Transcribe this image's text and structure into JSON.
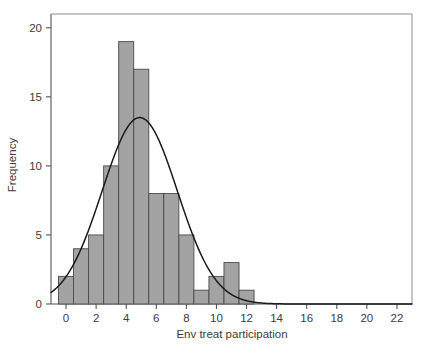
{
  "chart_data": {
    "type": "bar",
    "title": "",
    "subtitle": "",
    "xlabel": "Env treat participation",
    "ylabel": "Frequency",
    "categories": [
      0,
      1,
      2,
      3,
      4,
      5,
      6,
      7,
      8,
      9,
      10,
      11,
      12
    ],
    "values": [
      2,
      4,
      5,
      10,
      19,
      17,
      8,
      8,
      5,
      1,
      2,
      3,
      1
    ],
    "bin_width": 1,
    "n_total": 85,
    "xlim": [
      -1,
      23
    ],
    "ylim": [
      0,
      21
    ],
    "xticks": [
      0,
      2,
      4,
      6,
      8,
      10,
      12,
      14,
      16,
      18,
      20,
      22
    ],
    "xtick_labels": [
      "0",
      "2",
      "4",
      "6",
      "8",
      "10",
      "12",
      "14",
      "16",
      "18",
      "20",
      "22"
    ],
    "yticks": [
      0,
      5,
      10,
      15,
      20
    ],
    "ytick_labels": [
      "0",
      "5",
      "10",
      "15",
      "20"
    ],
    "grid": false,
    "legend": null,
    "legend_position": "none",
    "bar_fill_color": "#a3a3a3",
    "bar_edge_color": "#4a4a4a",
    "overlay": {
      "name": "normal-curve",
      "type": "line",
      "stroke_color": "#1a1a1a",
      "mean": 4.9,
      "sd": 2.5,
      "peak_value": 13.5,
      "peak_x": 4.9
    },
    "frame_color": "#8c8c8c",
    "background_color": "#ffffff"
  },
  "axes": {
    "y": {
      "label": "Frequency",
      "ticks": [
        {
          "value": 0,
          "label": "0"
        },
        {
          "value": 5,
          "label": "5"
        },
        {
          "value": 10,
          "label": "10"
        },
        {
          "value": 15,
          "label": "15"
        },
        {
          "value": 20,
          "label": "20"
        }
      ]
    },
    "x": {
      "label": "Env treat participation",
      "ticks": [
        {
          "value": 0,
          "label": "0"
        },
        {
          "value": 2,
          "label": "2"
        },
        {
          "value": 4,
          "label": "4"
        },
        {
          "value": 6,
          "label": "6"
        },
        {
          "value": 8,
          "label": "8"
        },
        {
          "value": 10,
          "label": "10"
        },
        {
          "value": 12,
          "label": "12"
        },
        {
          "value": 14,
          "label": "14"
        },
        {
          "value": 16,
          "label": "16"
        },
        {
          "value": 18,
          "label": "18"
        },
        {
          "value": 20,
          "label": "20"
        },
        {
          "value": 22,
          "label": "22"
        }
      ]
    }
  }
}
